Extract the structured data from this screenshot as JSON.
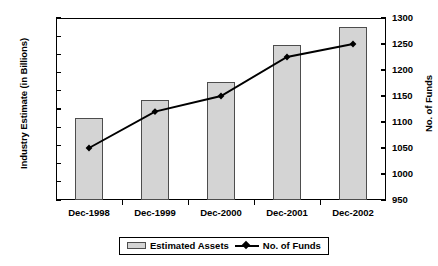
{
  "chart_data": {
    "type": "bar",
    "title": "",
    "subtitle": "",
    "categories": [
      "Dec-1998",
      "Dec-1999",
      "Dec-2000",
      "Dec-2001",
      "Dec-2002"
    ],
    "xlabel": "",
    "ylabel": "Industry Estimate (in Billions)",
    "ylabel_right": "No. of Funds",
    "ylim": [
      0,
      100
    ],
    "ylim_right": [
      950,
      1300
    ],
    "yticks": [
      0,
      10,
      20,
      30,
      40,
      50,
      60,
      70,
      80,
      90,
      100
    ],
    "yticks_right": [
      950,
      1000,
      1050,
      1100,
      1150,
      1200,
      1250,
      1300
    ],
    "grid": false,
    "legend_position": "bottom",
    "series": [
      {
        "name": "Estimated Assets",
        "type": "bar",
        "axis": "left",
        "color": "#d4d4d4",
        "edge_color": "#4d4d4d",
        "values": [
          45,
          55,
          65,
          85,
          95
        ]
      },
      {
        "name": "No. of Funds",
        "type": "line",
        "axis": "right",
        "color": "#000000",
        "marker": "diamond",
        "values": [
          1050,
          1120,
          1150,
          1225,
          1250
        ]
      }
    ]
  },
  "axes": {
    "left_title": "Industry Estimate (in Billions)",
    "right_title": "No. of Funds",
    "left_ticks": [
      "100",
      "90",
      "80",
      "70",
      "60",
      "50",
      "40",
      "30",
      "20",
      "10",
      "0"
    ],
    "right_ticks": [
      "1300",
      "1250",
      "1200",
      "1150",
      "1100",
      "1050",
      "1000",
      "950"
    ]
  },
  "legend": {
    "items": [
      {
        "label": "Estimated Assets",
        "marker": "bar-swatch"
      },
      {
        "label": "No. of Funds",
        "marker": "line-diamond-swatch"
      }
    ]
  }
}
